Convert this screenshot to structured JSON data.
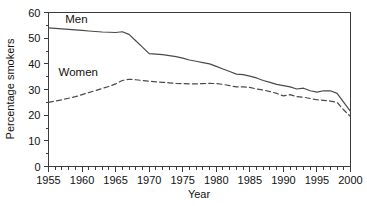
{
  "chart_data": {
    "type": "line",
    "title": "",
    "xlabel": "Year",
    "ylabel": "Percentage smokers",
    "xlim": [
      1955,
      2000
    ],
    "ylim": [
      0,
      60
    ],
    "grid": false,
    "legend_position": "inline-annotation",
    "x_major_ticks": [
      1955,
      1960,
      1965,
      1970,
      1975,
      1980,
      1985,
      1990,
      1995,
      2000
    ],
    "x_tick_labels": [
      "1955",
      "1960",
      "1965",
      "1970",
      "1975",
      "1980",
      "1985",
      "1990",
      "1995",
      "2000"
    ],
    "x_minor_tick_step": 1,
    "y_major_ticks": [
      0,
      10,
      20,
      30,
      40,
      50,
      60
    ],
    "y_tick_labels": [
      "0",
      "10",
      "20",
      "30",
      "40",
      "50",
      "60"
    ],
    "y_minor_tick_step": 5,
    "x": [
      1955,
      1956,
      1957,
      1958,
      1959,
      1960,
      1961,
      1962,
      1963,
      1964,
      1965,
      1966,
      1967,
      1968,
      1969,
      1970,
      1971,
      1972,
      1973,
      1974,
      1975,
      1976,
      1977,
      1978,
      1979,
      1980,
      1981,
      1982,
      1983,
      1984,
      1985,
      1986,
      1987,
      1988,
      1989,
      1990,
      1991,
      1992,
      1993,
      1994,
      1995,
      1996,
      1997,
      1998,
      1999,
      2000
    ],
    "series": [
      {
        "name": "Men",
        "label": "Men",
        "style": "solid",
        "color": "#4a4a4a",
        "label_x": 1957.5,
        "label_y": 57.5,
        "values": [
          54.0,
          53.8,
          53.6,
          53.4,
          53.2,
          53.0,
          52.8,
          52.6,
          52.4,
          52.3,
          52.2,
          52.5,
          51.5,
          49.0,
          46.5,
          44.0,
          43.8,
          43.6,
          43.2,
          42.8,
          42.2,
          41.5,
          41.0,
          40.5,
          40.0,
          39.0,
          38.0,
          37.0,
          36.0,
          35.8,
          35.2,
          34.5,
          33.5,
          32.8,
          32.0,
          31.5,
          31.0,
          30.2,
          30.5,
          29.5,
          29.0,
          29.5,
          29.5,
          28.5,
          25.0,
          21.5
        ]
      },
      {
        "name": "Women",
        "label": "Women",
        "style": "dashed",
        "color": "#4a4a4a",
        "label_x": 1956.5,
        "label_y": 37.0,
        "values": [
          25.0,
          25.5,
          26.0,
          26.6,
          27.2,
          28.0,
          28.8,
          29.6,
          30.4,
          31.2,
          32.2,
          33.5,
          34.0,
          33.8,
          33.5,
          33.2,
          33.0,
          32.8,
          32.6,
          32.4,
          32.3,
          32.2,
          32.2,
          32.3,
          32.4,
          32.3,
          32.0,
          31.5,
          31.0,
          31.0,
          30.8,
          30.2,
          29.8,
          29.2,
          28.5,
          27.5,
          28.0,
          27.2,
          27.0,
          26.5,
          26.0,
          25.8,
          25.5,
          25.0,
          22.0,
          19.5
        ]
      }
    ]
  }
}
